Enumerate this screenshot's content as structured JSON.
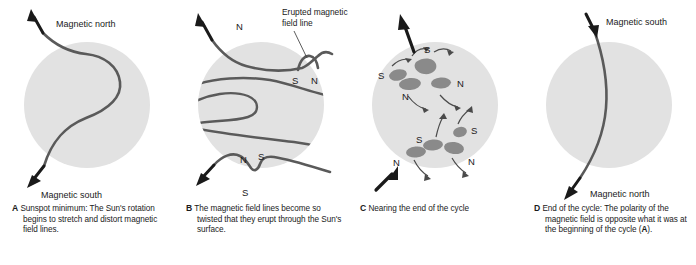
{
  "figure": {
    "background_color": "#ffffff",
    "sun_disc_color": "#e2e2e2",
    "field_line_color": "#5a5a5a",
    "sunspot_color": "#8a8a8a",
    "arrow_color": "#1a1a1a",
    "text_color": "#1a1a1a"
  },
  "panels": [
    {
      "letter": "A",
      "caption": "Sunspot minimum: The Sun's rotation begins to stretch and distort magnetic field lines.",
      "labels": {
        "top_pole": "Magnetic north",
        "bottom_pole": "Magnetic south"
      }
    },
    {
      "letter": "B",
      "caption": "The magnetic field lines become so twisted that they erupt through the Sun's surface.",
      "labels": {
        "callout": "Erupted magnetic field line",
        "callout_line1": "Erupted magnetic",
        "callout_line2": "field line",
        "top_outside": "N",
        "top_pair_left": "S",
        "top_pair_right": "N",
        "bottom_pair_left": "N",
        "bottom_pair_right": "S",
        "bottom_outside": "S"
      }
    },
    {
      "letter": "C",
      "caption": "Nearing the end of the cycle",
      "labels": {
        "upper_group": [
          "S",
          "S",
          "N",
          "N"
        ],
        "lower_group": [
          "S",
          "S",
          "N",
          "N"
        ]
      }
    },
    {
      "letter": "D",
      "caption_parts": {
        "before": "End of the cycle: The polarity of the magnetic field is opposite what it was at the beginning of the cycle (",
        "ref": "A",
        "after": ").",
        "full": "End of the cycle: The polarity of the magnetic field is opposite what it was at the beginning of the cycle (A)."
      },
      "labels": {
        "top_pole": "Magnetic south",
        "bottom_pole": "Magnetic north"
      }
    }
  ]
}
